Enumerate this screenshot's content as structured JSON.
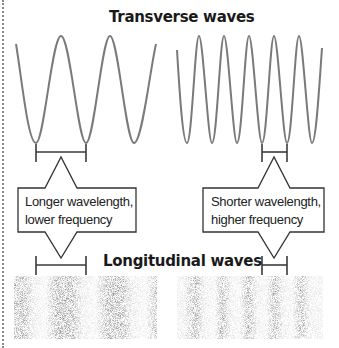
{
  "diagram": {
    "headings": {
      "transverse": "Transverse waves",
      "longitudinal": "Longitudinal waves"
    },
    "panels": [
      {
        "id": "left",
        "wave_type_top": "transverse",
        "wavelength_relative": "longer",
        "frequency_relative": "lower",
        "periods_shown": 3,
        "callout": {
          "line1": "Longer wavelength,",
          "line2": "lower frequency"
        }
      },
      {
        "id": "right",
        "wave_type_top": "transverse",
        "wavelength_relative": "shorter",
        "frequency_relative": "higher",
        "periods_shown": 6,
        "callout": {
          "line1": "Shorter wavelength,",
          "line2": "higher frequency"
        }
      }
    ],
    "colors": {
      "wave_stroke": "#7a7a7a",
      "bracket_stroke": "#3a3a3a",
      "callout_border": "#333333",
      "stipple_dark": "#9a9a9a",
      "stipple_light": "#e2e2e2",
      "text": "#1a1a1a"
    }
  }
}
